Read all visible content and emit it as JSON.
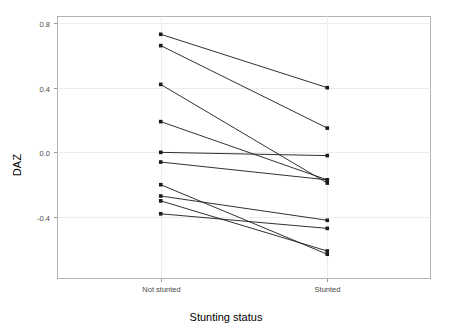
{
  "chart_data": {
    "type": "line",
    "title": "",
    "subtitle": "",
    "xlabel": "Stunting status",
    "ylabel": "DAZ",
    "categories": [
      "Not stunted",
      "Stunted"
    ],
    "x": [
      0,
      1
    ],
    "ytick_labels": [
      "0.8",
      "0.4",
      "0.0",
      "-0.4"
    ],
    "ytick_values": [
      0.8,
      0.4,
      0.0,
      -0.4
    ],
    "ylim": [
      -0.78,
      0.84
    ],
    "xlim": [
      -0.62,
      1.62
    ],
    "grid": true,
    "grid_axis": "y",
    "legend": "none",
    "marker": "square",
    "marker_color": "#1a1a1a",
    "line_color": "#1a1a1a",
    "panel_background": "#ffffff",
    "panel_border_color": "#b4b4b4",
    "series": [
      {
        "name": "pair-1",
        "values": [
          0.73,
          0.4
        ]
      },
      {
        "name": "pair-2",
        "values": [
          0.66,
          0.15
        ]
      },
      {
        "name": "pair-3",
        "values": [
          0.42,
          -0.19
        ]
      },
      {
        "name": "pair-4",
        "values": [
          0.19,
          -0.17
        ]
      },
      {
        "name": "pair-5",
        "values": [
          0.0,
          -0.02
        ]
      },
      {
        "name": "pair-6",
        "values": [
          -0.06,
          -0.17
        ]
      },
      {
        "name": "pair-7",
        "values": [
          -0.2,
          -0.63
        ]
      },
      {
        "name": "pair-8",
        "values": [
          -0.27,
          -0.42
        ]
      },
      {
        "name": "pair-9",
        "values": [
          -0.3,
          -0.61
        ]
      },
      {
        "name": "pair-10",
        "values": [
          -0.38,
          -0.47
        ]
      }
    ]
  },
  "axis": {
    "y_title": "DAZ",
    "x_title": "Stunting status"
  }
}
